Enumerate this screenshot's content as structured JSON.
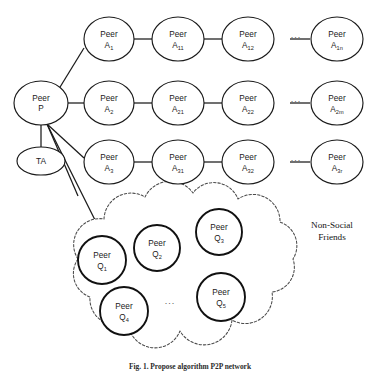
{
  "figure": {
    "caption": "Fig. 1.  Propose algorithm P2P network",
    "caption_visible": "clipped",
    "background_color": "#ffffff",
    "line_color": "#1a1a1a"
  },
  "region_labels": [
    {
      "id": "non-social-friends",
      "line1": "Non-Social",
      "line2": "Friends"
    }
  ],
  "hub": {
    "peer_p": {
      "line1": "Peer",
      "line2": "P"
    },
    "ta": {
      "label": "TA"
    }
  },
  "rows": [
    {
      "id": "row-a1",
      "nodes": [
        {
          "line1": "Peer",
          "base": "A",
          "sub": "1"
        },
        {
          "line1": "Peer",
          "base": "A",
          "sub": "11"
        },
        {
          "line1": "Peer",
          "base": "A",
          "sub": "12"
        },
        {
          "line1": "Peer",
          "base": "A",
          "sub": "1n"
        }
      ],
      "ellipsis": "..."
    },
    {
      "id": "row-a2",
      "nodes": [
        {
          "line1": "Peer",
          "base": "A",
          "sub": "2"
        },
        {
          "line1": "Peer",
          "base": "A",
          "sub": "21"
        },
        {
          "line1": "Peer",
          "base": "A",
          "sub": "22"
        },
        {
          "line1": "Peer",
          "base": "A",
          "sub": "2m"
        }
      ],
      "ellipsis": "..."
    },
    {
      "id": "row-a3",
      "nodes": [
        {
          "line1": "Peer",
          "base": "A",
          "sub": "3"
        },
        {
          "line1": "Peer",
          "base": "A",
          "sub": "31"
        },
        {
          "line1": "Peer",
          "base": "A",
          "sub": "32"
        },
        {
          "line1": "Peer",
          "base": "A",
          "sub": "3r"
        }
      ],
      "ellipsis": "..."
    }
  ],
  "cloud": {
    "ellipsis": "...",
    "nodes": [
      {
        "id": "q1",
        "line1": "Peer",
        "base": "Q",
        "sub": "1"
      },
      {
        "id": "q2",
        "line1": "Peer",
        "base": "Q",
        "sub": "2"
      },
      {
        "id": "q3",
        "line1": "Peer",
        "base": "Q",
        "sub": "3"
      },
      {
        "id": "q4",
        "line1": "Peer",
        "base": "Q",
        "sub": "4"
      },
      {
        "id": "q5",
        "line1": "Peer",
        "base": "Q",
        "sub": "5"
      },
      {
        "id": "qn",
        "line1": "Peer",
        "base": "Q",
        "sub": "n"
      }
    ]
  }
}
